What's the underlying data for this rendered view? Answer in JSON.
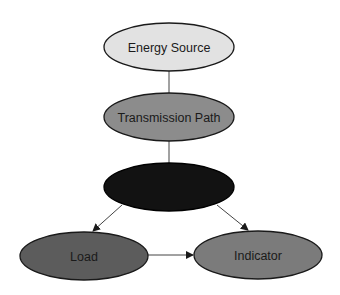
{
  "diagram": {
    "nodes": [
      {
        "id": "energy-source",
        "label": "Energy Source",
        "cx": 169,
        "cy": 47,
        "rx": 65,
        "ry": 24,
        "fill": "#e2e2e2"
      },
      {
        "id": "transmission-path",
        "label": "Transmission Path",
        "cx": 169,
        "cy": 117,
        "rx": 65,
        "ry": 24,
        "fill": "#8c8c8c"
      },
      {
        "id": "unlabeled-node",
        "label": "",
        "cx": 169,
        "cy": 187,
        "rx": 65,
        "ry": 24,
        "fill": "#121212"
      },
      {
        "id": "load",
        "label": "Load",
        "cx": 84,
        "cy": 256,
        "rx": 64,
        "ry": 24,
        "fill": "#5c5c5c"
      },
      {
        "id": "indicator",
        "label": "Indicator",
        "cx": 258,
        "cy": 255,
        "rx": 64,
        "ry": 24,
        "fill": "#7b7b7b"
      }
    ],
    "edges": [
      {
        "from": "energy-source",
        "to": "transmission-path",
        "arrow": false
      },
      {
        "from": "transmission-path",
        "to": "unlabeled-node",
        "arrow": false
      },
      {
        "from": "unlabeled-node",
        "to": "load",
        "arrow": true
      },
      {
        "from": "unlabeled-node",
        "to": "indicator",
        "arrow": true
      },
      {
        "from": "load",
        "to": "indicator",
        "arrow": true
      }
    ]
  }
}
